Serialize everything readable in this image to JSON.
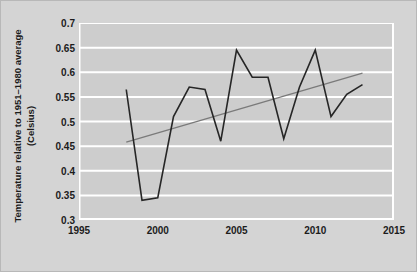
{
  "chart_data": {
    "type": "line",
    "title": "",
    "xlabel": "",
    "ylabel": "Temperature relative to 1951–1980 average (Celsius)",
    "ylabel_line1": "Temperature relative to 1951–1980 average",
    "ylabel_line2": "(Celsius)",
    "xlim": [
      1995,
      2015
    ],
    "ylim": [
      0.3,
      0.7
    ],
    "xticks": [
      1995,
      2000,
      2005,
      2010,
      2015
    ],
    "xtick_labels": [
      "1995",
      "2000",
      "2005",
      "2010",
      "2015"
    ],
    "yticks": [
      0.3,
      0.35,
      0.4,
      0.45,
      0.5,
      0.55,
      0.6,
      0.65,
      0.7
    ],
    "ytick_labels": [
      "0.3",
      "0.35",
      "0.4",
      "0.45",
      "0.5",
      "0.55",
      "0.6",
      "0.65",
      "0.7"
    ],
    "grid": true,
    "grid_axis": "y",
    "grid_color": "#ffffff",
    "plot_background": "#cdcdcd",
    "figure_background": "#d4d4d4",
    "legend": "none",
    "x": [
      1998,
      1999,
      2000,
      2001,
      2002,
      2003,
      2004,
      2005,
      2006,
      2007,
      2008,
      2009,
      2010,
      2011,
      2012,
      2013
    ],
    "series": [
      {
        "name": "Temperature anomaly",
        "color": "#262626",
        "width": 1.6,
        "values": [
          0.565,
          0.34,
          0.345,
          0.51,
          0.57,
          0.565,
          0.46,
          0.645,
          0.59,
          0.59,
          0.465,
          0.57,
          0.645,
          0.51,
          0.555,
          0.575
        ]
      },
      {
        "name": "Linear trend",
        "color": "#7a7a7a",
        "width": 1.3,
        "x": [
          1998,
          2013
        ],
        "values": [
          0.458,
          0.598
        ]
      }
    ]
  }
}
